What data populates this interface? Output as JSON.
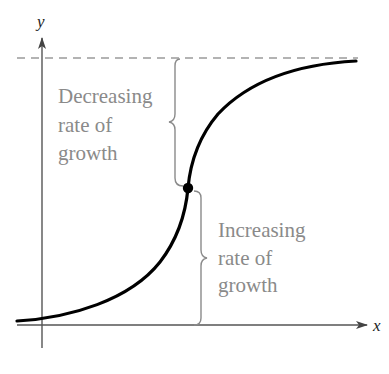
{
  "diagram": {
    "type": "logistic-growth-curve",
    "axes": {
      "x_label": "x",
      "y_label": "y"
    },
    "annotations": {
      "upper": {
        "line1": "Decreasing",
        "line2": "rate of",
        "line3": "growth"
      },
      "lower": {
        "line1": "Increasing",
        "line2": "rate of",
        "line3": "growth"
      }
    },
    "elements": {
      "asymptote": "horizontal dashed line (upper limit)",
      "inflection_point": "filled dot where growth rate changes"
    },
    "colors": {
      "curve": "#000000",
      "axes": "#555555",
      "asymptote": "#9a9a9a",
      "annotation_text": "#8a8a8a",
      "braces": "#8a8a8a"
    }
  }
}
